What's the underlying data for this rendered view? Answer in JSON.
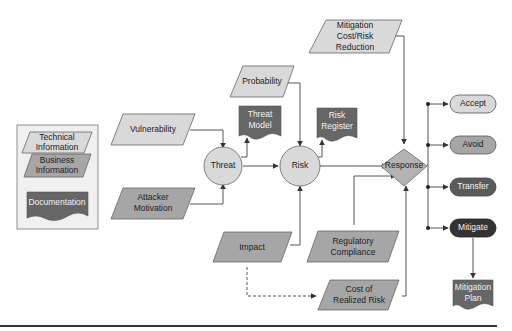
{
  "legend": {
    "items": [
      {
        "label_lines": [
          "Technical",
          "Information"
        ],
        "shape": "parallelogram",
        "fill": "#d9d9d9"
      },
      {
        "label_lines": [
          "Business",
          "Information"
        ],
        "shape": "parallelogram",
        "fill": "#a6a6a6"
      },
      {
        "label_lines": [
          "Documentation"
        ],
        "shape": "document",
        "fill": "#666666"
      }
    ]
  },
  "nodes": {
    "vulnerability": {
      "label": "Vulnerability"
    },
    "attacker_motivation": {
      "line1": "Attacker",
      "line2": "Motivation"
    },
    "threat": {
      "label": "Threat"
    },
    "threat_model": {
      "line1": "Threat",
      "line2": "Model"
    },
    "probability": {
      "label": "Probability"
    },
    "risk": {
      "label": "Risk"
    },
    "risk_register": {
      "line1": "Risk",
      "line2": "Register"
    },
    "mitigation_cost": {
      "line1": "Mitigation",
      "line2": "Cost/Risk",
      "line3": "Reduction"
    },
    "response": {
      "label": "Response"
    },
    "impact": {
      "label": "Impact"
    },
    "regulatory_compliance": {
      "line1": "Regulatory",
      "line2": "Compliance"
    },
    "cost_realized_risk": {
      "line1": "Cost of",
      "line2": "Realized Risk"
    },
    "accept": {
      "label": "Accept"
    },
    "avoid": {
      "label": "Avoid"
    },
    "transfer": {
      "label": "Transfer"
    },
    "mitigate": {
      "label": "Mitigate"
    },
    "mitigation_plan": {
      "line1": "Mitigation",
      "line2": "Plan"
    }
  },
  "colors": {
    "technical": "#d9d9d9",
    "business": "#a6a6a6",
    "documentation": "#666666",
    "process": "#d9d9d9",
    "line": "#555555",
    "accept": "#d9d9d9",
    "avoid": "#a6a6a6",
    "transfer": "#5a5a5a",
    "mitigate": "#333333"
  }
}
